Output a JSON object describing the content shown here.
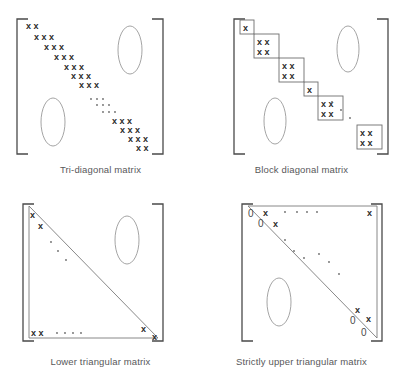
{
  "figure": {
    "background": "#ffffff",
    "ink": "#3a3a3a"
  },
  "glyphs": {
    "entry": "x",
    "zero": "0",
    "dot": "."
  },
  "panels": [
    {
      "id": "tri-diagonal",
      "caption": "Tri-diagonal matrix",
      "entry_rows": [
        {
          "count": 2,
          "label": "x x"
        },
        {
          "count": 3,
          "label": "x x x"
        },
        {
          "count": 3,
          "label": "x x x"
        },
        {
          "count": 3,
          "label": "x x x"
        },
        {
          "count": 3,
          "label": "x x x"
        },
        {
          "count": 3,
          "label": "x x x"
        },
        {
          "count": 3,
          "label": "x x x"
        },
        {
          "count": 3,
          "label": "x x x"
        },
        {
          "count": 3,
          "label": "x x x"
        },
        {
          "count": 3,
          "label": "x x x"
        },
        {
          "count": 2,
          "label": "x x"
        }
      ],
      "ellipses": 2,
      "dot_rows": 3,
      "bracket": "square"
    },
    {
      "id": "block-diagonal",
      "caption": "Block diagonal matrix",
      "blocks": [
        {
          "cols": 1,
          "rows": 1
        },
        {
          "cols": 2,
          "rows": 2
        },
        {
          "cols": 2,
          "rows": 2
        },
        {
          "cols": 1,
          "rows": 1
        },
        {
          "cols": 2,
          "rows": 2
        },
        {
          "cols": 2,
          "rows": 2
        }
      ],
      "ellipses": 2,
      "dot_rows": 3,
      "bracket": "square"
    },
    {
      "id": "lower-triangular",
      "caption": "Lower triangular matrix",
      "corner_entries": [
        "x",
        "x",
        "x",
        "x",
        "x",
        "x"
      ],
      "bottom_row": "x x  . . . .",
      "ellipses": 1,
      "bracket": "square"
    },
    {
      "id": "strictly-upper-triangular",
      "caption": "Strictly upper triangular matrix",
      "top_left": [
        "0",
        "x",
        "0",
        "x"
      ],
      "top_right": "x",
      "bottom_right": [
        "x",
        "0",
        "x",
        "0"
      ],
      "ellipses": 1,
      "bracket": "square"
    }
  ]
}
